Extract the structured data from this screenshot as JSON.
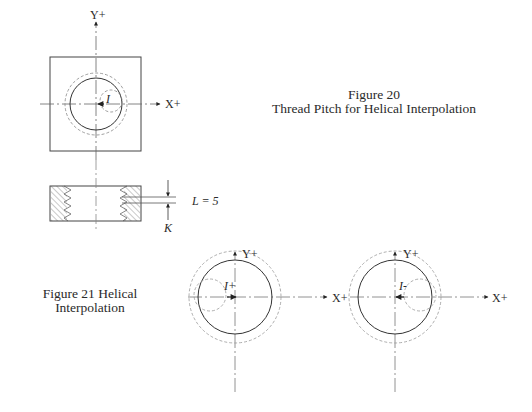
{
  "figure20": {
    "title_line1": "Figure 20",
    "title_line2": "Thread Pitch for Helical Interpolation",
    "front_view": {
      "y_axis_label": "Y+",
      "x_axis_label": "X+",
      "offset_label": "I"
    },
    "side_view": {
      "pitch_label": "L = 5",
      "depth_label": "K"
    }
  },
  "figure21": {
    "caption_line1": "Figure 21  Helical",
    "caption_line2": "Interpolation",
    "left": {
      "y_axis_label": "Y+",
      "x_axis_label": "X+",
      "offset_label": "I+"
    },
    "right": {
      "y_axis_label": "Y+",
      "x_axis_label": "X+",
      "offset_label": "I-"
    }
  },
  "colors": {
    "line": "#333333",
    "dashed": "#888888",
    "centerline": "#777777",
    "hatch": "#777777"
  }
}
